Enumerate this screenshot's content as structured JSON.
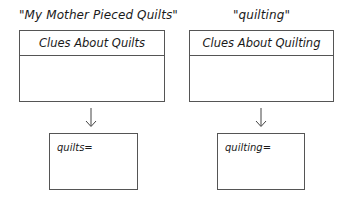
{
  "left": {
    "title": "\"My Mother Pieced Quilts\"",
    "box_header": "Clues About Quilts",
    "answer_label": "quilts="
  },
  "right": {
    "title": "\"quilting\"",
    "box_header": "Clues About Quilting",
    "answer_label": "quilting="
  },
  "icons": {
    "arrow": "arrow-down-icon"
  },
  "colors": {
    "line": "#555555",
    "text": "#1a1a1a",
    "background": "#ffffff"
  }
}
